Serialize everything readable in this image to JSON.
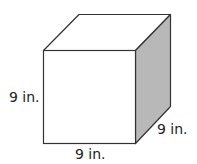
{
  "diagram": {
    "shape": "cube",
    "labels": {
      "height": "9 in.",
      "width": "9 in.",
      "depth": "9 in."
    },
    "colors": {
      "stroke": "#333333",
      "front_face": "#ffffff",
      "top_face": "#ffffff",
      "side_face": "#b8b8b8"
    }
  }
}
